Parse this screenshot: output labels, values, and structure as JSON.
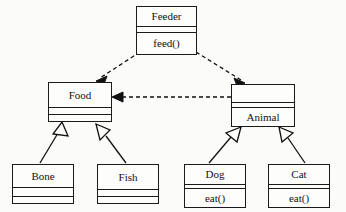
{
  "diagram": {
    "type": "uml-class-diagram",
    "background_color": "#fbfbfa",
    "line_color": "#111111",
    "box_fill": "#fdfdfc"
  },
  "classes": [
    {
      "id": "feeder",
      "name": "Feeder",
      "attributes": "",
      "operations": "feed()",
      "x": 136,
      "y": 6,
      "width": 61,
      "height": 49,
      "name_h": 19,
      "attrs_h": 8,
      "ops_h": 22
    },
    {
      "id": "food",
      "name": "Food",
      "attributes": "",
      "operations": "",
      "x": 48,
      "y": 82,
      "width": 64,
      "height": 40,
      "name_h": 24,
      "attrs_h": 9,
      "ops_h": 7
    },
    {
      "id": "animal",
      "name": "Animal",
      "attributes": "",
      "operations": "",
      "x": 231,
      "y": 84,
      "width": 64,
      "height": 43,
      "name_h": 19,
      "attrs_h": 5,
      "ops_h": 19
    },
    {
      "id": "bone",
      "name": "Bone",
      "attributes": "",
      "operations": "",
      "x": 12,
      "y": 164,
      "width": 62,
      "height": 40,
      "name_h": 22,
      "attrs_h": 11,
      "ops_h": 7
    },
    {
      "id": "fish",
      "name": "Fish",
      "attributes": "",
      "operations": "",
      "x": 97,
      "y": 164,
      "width": 62,
      "height": 40,
      "name_h": 24,
      "attrs_h": 9,
      "ops_h": 7
    },
    {
      "id": "dog",
      "name": "Dog",
      "attributes": "",
      "operations": "eat()",
      "x": 184,
      "y": 164,
      "width": 62,
      "height": 44,
      "name_h": 19,
      "attrs_h": 6,
      "ops_h": 19
    },
    {
      "id": "cat",
      "name": "Cat",
      "attributes": "",
      "operations": "eat()",
      "x": 268,
      "y": 164,
      "width": 62,
      "height": 44,
      "name_h": 19,
      "attrs_h": 6,
      "ops_h": 19
    }
  ],
  "relationships": [
    {
      "id": "feeder-food",
      "kind": "dependency",
      "label": "",
      "from": "feeder",
      "to": "food",
      "style": "dashed",
      "arrowhead": "solid-open"
    },
    {
      "id": "feeder-animal",
      "kind": "dependency",
      "label": "",
      "from": "feeder",
      "to": "animal",
      "style": "dashed",
      "arrowhead": "solid-open"
    },
    {
      "id": "animal-food",
      "kind": "dependency",
      "label": "",
      "from": "animal",
      "to": "food",
      "style": "dashed",
      "arrowhead": "solid-open"
    },
    {
      "id": "bone-food",
      "kind": "generalization",
      "label": "",
      "from": "bone",
      "to": "food",
      "style": "solid",
      "arrowhead": "hollow-triangle"
    },
    {
      "id": "fish-food",
      "kind": "generalization",
      "label": "",
      "from": "fish",
      "to": "food",
      "style": "solid",
      "arrowhead": "hollow-triangle"
    },
    {
      "id": "dog-animal",
      "kind": "generalization",
      "label": "",
      "from": "dog",
      "to": "animal",
      "style": "solid",
      "arrowhead": "hollow-triangle"
    },
    {
      "id": "cat-animal",
      "kind": "generalization",
      "label": "",
      "from": "cat",
      "to": "animal",
      "style": "solid",
      "arrowhead": "hollow-triangle"
    }
  ]
}
